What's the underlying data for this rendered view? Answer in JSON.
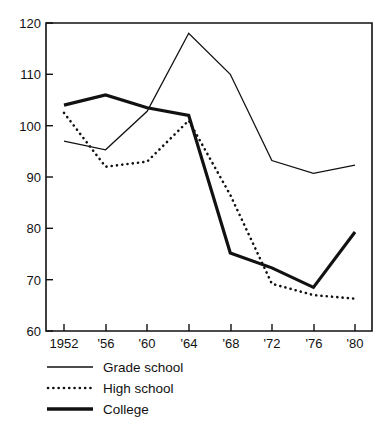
{
  "chart_data": {
    "type": "line",
    "title": "",
    "xlabel": "",
    "ylabel": "",
    "categories": [
      "1952",
      "'56",
      "'60",
      "'64",
      "'68",
      "'72",
      "'76",
      "'80"
    ],
    "x_values": [
      1952,
      1956,
      1960,
      1964,
      1968,
      1972,
      1976,
      1980
    ],
    "xtick_labels": [
      "1952",
      "'56",
      "'60",
      "'64",
      "'68",
      "'72",
      "'76",
      "'80"
    ],
    "ytick_labels": [
      "60",
      "70",
      "80",
      "90",
      "100",
      "110",
      "120"
    ],
    "ytick_values": [
      60,
      70,
      80,
      90,
      100,
      110,
      120
    ],
    "ylim": [
      60,
      120
    ],
    "grid": false,
    "legend_position": "below-left",
    "series": [
      {
        "name": "Grade school",
        "style": "thin-solid",
        "values": [
          97.0,
          95.3,
          102.8,
          118.0,
          110.0,
          93.2,
          90.7,
          92.3
        ]
      },
      {
        "name": "High school",
        "style": "dotted",
        "values": [
          102.5,
          92.0,
          93.0,
          101.0,
          86.5,
          69.2,
          67.0,
          66.3
        ]
      },
      {
        "name": "College",
        "style": "thick-solid",
        "values": [
          104.0,
          106.0,
          103.5,
          102.0,
          75.2,
          72.3,
          68.5,
          79.3
        ]
      }
    ]
  },
  "legend": {
    "items": [
      {
        "label": "Grade school",
        "swatch": "thin-solid-line-icon"
      },
      {
        "label": "High school",
        "swatch": "dotted-line-icon"
      },
      {
        "label": "College",
        "swatch": "thick-solid-line-icon"
      }
    ]
  },
  "axes": {
    "y_labels": [
      "120",
      "110",
      "100",
      "90",
      "80",
      "70",
      "60"
    ],
    "x_labels": [
      "1952",
      "'56",
      "'60",
      "'64",
      "'68",
      "'72",
      "'76",
      "'80"
    ]
  }
}
